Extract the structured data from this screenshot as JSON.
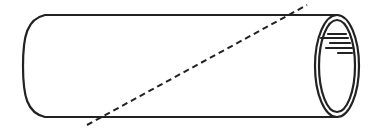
{
  "figure": {
    "colors": {
      "stroke": "#222222",
      "background": "#ffffff"
    },
    "cylinder": {
      "top_y": 15,
      "bottom_y": 117,
      "left_x": 45,
      "left_cap_bulge_x": 23,
      "right_center_x": 337,
      "center_y": 66,
      "outer_rx": 22,
      "outer_ry": 51,
      "inner_rx": 18,
      "inner_ry": 46
    },
    "cut_line": {
      "style": "dashed",
      "x1": 87,
      "y1": 125,
      "x2": 307,
      "y2": 5
    },
    "highlights": [
      {
        "x1": 328,
        "y1": 34,
        "x2": 346,
        "y2": 34
      },
      {
        "x1": 321,
        "y1": 38,
        "x2": 348,
        "y2": 38
      },
      {
        "x1": 330,
        "y1": 43,
        "x2": 350,
        "y2": 43
      },
      {
        "x1": 326,
        "y1": 48,
        "x2": 352,
        "y2": 48
      },
      {
        "x1": 338,
        "y1": 53,
        "x2": 352,
        "y2": 53
      }
    ]
  }
}
